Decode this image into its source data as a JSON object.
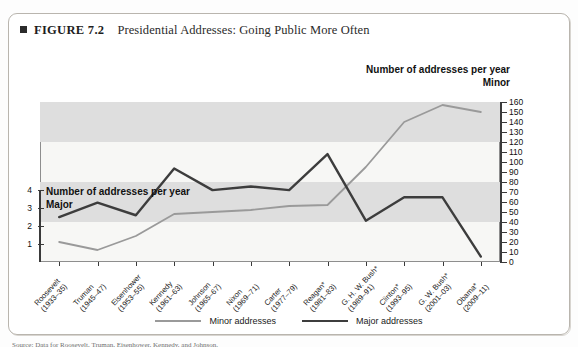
{
  "figure": {
    "label": "FIGURE 7.2",
    "title": "Presidential Addresses: Going Public More Often",
    "source": "Source: Data for Roosevelt, Truman, Eisenhower, Kennedy, and Johnson."
  },
  "axes": {
    "right_heading_line1": "Number of addresses per year",
    "right_heading_line2": "Minor",
    "left_heading_line1": "Number of addresses per year",
    "left_heading_line2": "Major",
    "right_ticks": [
      "0",
      "10",
      "20",
      "30",
      "40",
      "50",
      "60",
      "70",
      "80",
      "90",
      "100",
      "110",
      "120",
      "130",
      "140",
      "150",
      "160"
    ],
    "left_ticks": [
      "1",
      "2",
      "3",
      "4",
      "5",
      "6",
      "7",
      "8"
    ]
  },
  "legend": {
    "items": [
      {
        "label": "Minor addresses",
        "color": "#9a9a9a",
        "width": "2px"
      },
      {
        "label": "Major addresses",
        "color": "#3d3d3d",
        "width": "2.6px"
      }
    ]
  },
  "chart_data": {
    "type": "line",
    "title": "Presidential Addresses: Going Public More Often",
    "xlabel": "",
    "ylabel_left": "Number of addresses per year Major",
    "ylabel_right": "Number of addresses per year Minor",
    "ylim_left": [
      0,
      8.9
    ],
    "ylim_right": [
      0,
      160
    ],
    "grid": "horizontal-bands",
    "legend_position": "bottom-center",
    "categories": [
      "Roosevelt\n(1933–35)",
      "Truman\n(1945–47)",
      "Eisenhower\n(1953–55)",
      "Kennedy\n(1961–63)",
      "Johnson\n(1965–67)",
      "Nixon\n(1969–71)",
      "Carter\n(1977–79)",
      "Reagan*\n(1981–83)",
      "G. H. W. Bush*\n(1989–91)",
      "Clinton*\n(1993–95)",
      "G. W. Bush*\n(2001–03)",
      "Obama*\n(2009–11)"
    ],
    "series": [
      {
        "name": "Minor addresses",
        "axis": "right",
        "color": "#9a9a9a",
        "values": [
          20,
          12,
          26,
          48,
          50,
          52,
          56,
          57,
          95,
          140,
          157,
          150
        ]
      },
      {
        "name": "Major addresses",
        "axis": "left",
        "color": "#3d3d3d",
        "values": [
          2.5,
          3.3,
          2.6,
          5.2,
          4.0,
          4.2,
          4.0,
          6.0,
          2.3,
          3.6,
          3.6,
          0.3
        ]
      }
    ]
  }
}
